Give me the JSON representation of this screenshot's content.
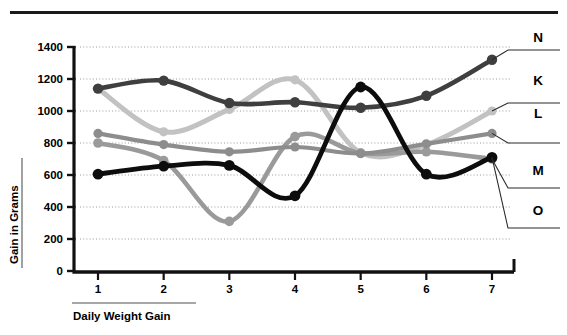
{
  "title": "",
  "chart_data": {
    "type": "line",
    "title": "",
    "xlabel": "Daily Weight Gain",
    "ylabel": "Gain in Grams",
    "x": [
      1,
      2,
      3,
      4,
      5,
      6,
      7
    ],
    "xticklabels": [
      "1",
      "2",
      "3",
      "4",
      "5",
      "6",
      "7"
    ],
    "yticks": [
      0,
      200,
      400,
      600,
      800,
      1000,
      1200,
      1400
    ],
    "yticklabels": [
      "0",
      "200",
      "400",
      "600",
      "800",
      "1000",
      "1200",
      "1400"
    ],
    "ylim": [
      0,
      1400
    ],
    "xlim": [
      0.5,
      7.5
    ],
    "grid": "horizontal-dotted",
    "legend_position": "right-labels-with-leader-lines",
    "series": [
      {
        "name": "N",
        "color": "#3f3f3f",
        "values": [
          1140,
          1190,
          1050,
          1055,
          1020,
          1095,
          1320
        ]
      },
      {
        "name": "K",
        "color": "#8d8d8d",
        "values": [
          860,
          790,
          745,
          775,
          735,
          795,
          860
        ]
      },
      {
        "name": "L",
        "color": "#c2c2c2",
        "values": [
          1140,
          870,
          1010,
          1195,
          740,
          790,
          1000
        ]
      },
      {
        "name": "M",
        "color": "#9a9a9a",
        "values": [
          800,
          690,
          310,
          840,
          735,
          745,
          700
        ]
      },
      {
        "name": "O",
        "color": "#0d0d0d",
        "values": [
          605,
          655,
          660,
          470,
          1150,
          605,
          710
        ]
      }
    ]
  }
}
